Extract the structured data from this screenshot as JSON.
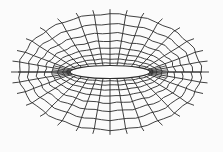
{
  "figure": {
    "type": "quadrilateral-mesh",
    "background": "#fbfbfb",
    "line_color": "#2b2b2b",
    "center": [
      110,
      72
    ],
    "hole": {
      "rx": 40,
      "ry": 6.5
    },
    "rings": [
      {
        "rx": 43,
        "ry": 9
      },
      {
        "rx": 47,
        "ry": 13
      },
      {
        "rx": 52,
        "ry": 18
      },
      {
        "rx": 58,
        "ry": 24
      },
      {
        "rx": 65,
        "ry": 31
      },
      {
        "rx": 73,
        "ry": 39
      },
      {
        "rx": 82,
        "ry": 48
      },
      {
        "rx": 91,
        "ry": 58
      }
    ],
    "spokes_deg": [
      0,
      10,
      20,
      32,
      45,
      58,
      70,
      80,
      90,
      100,
      110,
      122,
      135,
      148,
      160,
      170,
      180,
      190,
      200,
      212,
      225,
      238,
      250,
      260,
      270,
      280,
      290,
      302,
      315,
      328,
      340,
      350
    ],
    "dense_spokes_deg": [
      5,
      15,
      165,
      175,
      185,
      195,
      345,
      355
    ],
    "outer_extension": 8,
    "midline": {
      "x1": 18,
      "x2": 202,
      "y": 72
    }
  }
}
